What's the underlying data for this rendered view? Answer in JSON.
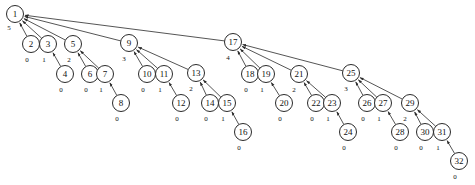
{
  "figure": {
    "kind": "directed-tree-diagram",
    "width": 475,
    "height": 185,
    "background_color": "#ffffff",
    "node_fill_color": "#ffffff",
    "node_stroke_color": "#2a2a2a",
    "edge_color": "#2a2a2a",
    "text_color": "#111111",
    "edge_direction": "child-to-parent",
    "node_radius": 8.5
  },
  "chart_data": {
    "type": "diagram",
    "title": "",
    "nodes": [
      {
        "id": "1",
        "label": "1",
        "count": "5",
        "x": 15,
        "y": 14,
        "count_x": 9,
        "count_y": 28
      },
      {
        "id": "2",
        "label": "2",
        "count": "0",
        "x": 31,
        "y": 44,
        "count_x": 27,
        "count_y": 60
      },
      {
        "id": "3",
        "label": "3",
        "count": "1",
        "x": 48,
        "y": 44,
        "count_x": 44,
        "count_y": 60
      },
      {
        "id": "4",
        "label": "4",
        "count": "0",
        "x": 65,
        "y": 74,
        "count_x": 61,
        "count_y": 90
      },
      {
        "id": "5",
        "label": "5",
        "count": "2",
        "x": 73,
        "y": 44,
        "count_x": 69,
        "count_y": 60
      },
      {
        "id": "6",
        "label": "6",
        "count": "0",
        "x": 90,
        "y": 74,
        "count_x": 86,
        "count_y": 90
      },
      {
        "id": "7",
        "label": "7",
        "count": "1",
        "x": 105,
        "y": 74,
        "count_x": 101,
        "count_y": 90
      },
      {
        "id": "8",
        "label": "8",
        "count": "0",
        "x": 121,
        "y": 103,
        "count_x": 117,
        "count_y": 119
      },
      {
        "id": "9",
        "label": "9",
        "count": "3",
        "x": 129,
        "y": 43,
        "count_x": 124,
        "count_y": 59
      },
      {
        "id": "10",
        "label": "10",
        "count": "0",
        "x": 147,
        "y": 74,
        "count_x": 143,
        "count_y": 90
      },
      {
        "id": "11",
        "label": "11",
        "count": "1",
        "x": 164,
        "y": 74,
        "count_x": 160,
        "count_y": 90
      },
      {
        "id": "12",
        "label": "12",
        "count": "0",
        "x": 181,
        "y": 103,
        "count_x": 177,
        "count_y": 119
      },
      {
        "id": "13",
        "label": "13",
        "count": "2",
        "x": 196,
        "y": 73,
        "count_x": 191,
        "count_y": 89
      },
      {
        "id": "14",
        "label": "14",
        "count": "0",
        "x": 210,
        "y": 103,
        "count_x": 206,
        "count_y": 119
      },
      {
        "id": "15",
        "label": "15",
        "count": "1",
        "x": 227,
        "y": 103,
        "count_x": 223,
        "count_y": 119
      },
      {
        "id": "16",
        "label": "16",
        "count": "0",
        "x": 243,
        "y": 132,
        "count_x": 239,
        "count_y": 148
      },
      {
        "id": "17",
        "label": "17",
        "count": "4",
        "x": 233,
        "y": 42,
        "count_x": 228,
        "count_y": 58
      },
      {
        "id": "18",
        "label": "18",
        "count": "0",
        "x": 250,
        "y": 74,
        "count_x": 246,
        "count_y": 90
      },
      {
        "id": "19",
        "label": "19",
        "count": "1",
        "x": 266,
        "y": 74,
        "count_x": 262,
        "count_y": 90
      },
      {
        "id": "20",
        "label": "20",
        "count": "0",
        "x": 284,
        "y": 103,
        "count_x": 280,
        "count_y": 119
      },
      {
        "id": "21",
        "label": "21",
        "count": "2",
        "x": 299,
        "y": 74,
        "count_x": 294,
        "count_y": 90
      },
      {
        "id": "22",
        "label": "22",
        "count": "0",
        "x": 316,
        "y": 103,
        "count_x": 312,
        "count_y": 119
      },
      {
        "id": "23",
        "label": "23",
        "count": "1",
        "x": 332,
        "y": 103,
        "count_x": 328,
        "count_y": 119
      },
      {
        "id": "24",
        "label": "24",
        "count": "0",
        "x": 348,
        "y": 132,
        "count_x": 344,
        "count_y": 148
      },
      {
        "id": "25",
        "label": "25",
        "count": "3",
        "x": 351,
        "y": 73,
        "count_x": 346,
        "count_y": 89
      },
      {
        "id": "26",
        "label": "26",
        "count": "0",
        "x": 367,
        "y": 103,
        "count_x": 363,
        "count_y": 119
      },
      {
        "id": "27",
        "label": "27",
        "count": "1",
        "x": 383,
        "y": 103,
        "count_x": 379,
        "count_y": 119
      },
      {
        "id": "28",
        "label": "28",
        "count": "0",
        "x": 400,
        "y": 132,
        "count_x": 396,
        "count_y": 148
      },
      {
        "id": "29",
        "label": "29",
        "count": "2",
        "x": 410,
        "y": 103,
        "count_x": 405,
        "count_y": 119
      },
      {
        "id": "30",
        "label": "30",
        "count": "0",
        "x": 425,
        "y": 132,
        "count_x": 421,
        "count_y": 148
      },
      {
        "id": "31",
        "label": "31",
        "count": "1",
        "x": 442,
        "y": 132,
        "count_x": 438,
        "count_y": 148
      },
      {
        "id": "32",
        "label": "32",
        "count": "0",
        "x": 459,
        "y": 161,
        "count_x": 455,
        "count_y": 177
      }
    ],
    "edges": [
      {
        "from": "2",
        "to": "1"
      },
      {
        "from": "3",
        "to": "1"
      },
      {
        "from": "5",
        "to": "1"
      },
      {
        "from": "9",
        "to": "1"
      },
      {
        "from": "17",
        "to": "1"
      },
      {
        "from": "4",
        "to": "3"
      },
      {
        "from": "6",
        "to": "5"
      },
      {
        "from": "7",
        "to": "5"
      },
      {
        "from": "8",
        "to": "7"
      },
      {
        "from": "10",
        "to": "9"
      },
      {
        "from": "11",
        "to": "9"
      },
      {
        "from": "13",
        "to": "9"
      },
      {
        "from": "12",
        "to": "11"
      },
      {
        "from": "14",
        "to": "13"
      },
      {
        "from": "15",
        "to": "13"
      },
      {
        "from": "16",
        "to": "15"
      },
      {
        "from": "18",
        "to": "17"
      },
      {
        "from": "19",
        "to": "17"
      },
      {
        "from": "21",
        "to": "17"
      },
      {
        "from": "25",
        "to": "17"
      },
      {
        "from": "20",
        "to": "19"
      },
      {
        "from": "22",
        "to": "21"
      },
      {
        "from": "23",
        "to": "21"
      },
      {
        "from": "24",
        "to": "23"
      },
      {
        "from": "26",
        "to": "25"
      },
      {
        "from": "27",
        "to": "25"
      },
      {
        "from": "29",
        "to": "25"
      },
      {
        "from": "28",
        "to": "27"
      },
      {
        "from": "30",
        "to": "29"
      },
      {
        "from": "31",
        "to": "29"
      },
      {
        "from": "32",
        "to": "31"
      }
    ]
  }
}
